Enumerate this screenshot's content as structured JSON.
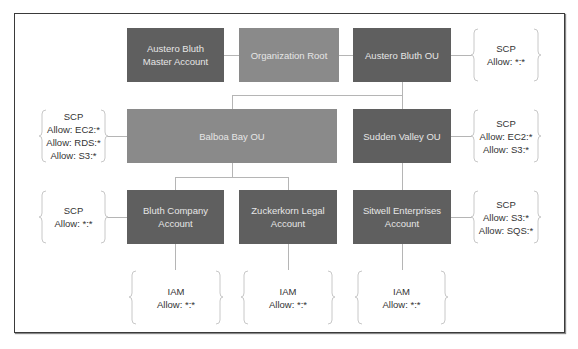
{
  "diagram": {
    "type": "AWS Organizations hierarchy with SCP/IAM policies",
    "colors": {
      "account_box": "#5f5f5f",
      "ou_box": "#8a8a8a",
      "box_text": "#e6e6e6",
      "policy_text": "#333333",
      "connector": "#b5b5b5"
    },
    "nodes": {
      "master": "Austero Bluth Master Account",
      "root": "Organization Root",
      "austero_ou": "Austero Bluth OU",
      "balboa_ou": "Balboa Bay OU",
      "sudden_ou": "Sudden Valley OU",
      "bluth_acct": "Bluth Company Account",
      "zuck_acct": "Zuckerkorn Legal Account",
      "sitwell_acct": "Sitwell Enterprises Account"
    },
    "master_l1": "Austero Bluth",
    "master_l2": "Master Account",
    "bluth_l1": "Bluth Company",
    "bluth_l2": "Account",
    "zuck_l1": "Zuckerkorn Legal",
    "zuck_l2": "Account",
    "sitwell_l1": "Sitwell Enterprises",
    "sitwell_l2": "Account",
    "policies": {
      "austero_scp": {
        "title": "SCP",
        "lines": [
          "Allow: *:*"
        ]
      },
      "balboa_scp": {
        "title": "SCP",
        "lines": [
          "Allow: EC2:*",
          "Allow: RDS:*",
          "Allow: S3:*"
        ]
      },
      "sudden_scp": {
        "title": "SCP",
        "lines": [
          "Allow: EC2:*",
          "Allow: S3:*"
        ]
      },
      "bluth_scp": {
        "title": "SCP",
        "lines": [
          "Allow: *:*"
        ]
      },
      "sitwell_scp": {
        "title": "SCP",
        "lines": [
          "Allow: S3:*",
          "Allow: SQS:*"
        ]
      },
      "bluth_iam": {
        "title": "IAM",
        "lines": [
          "Allow: *:*"
        ]
      },
      "zuck_iam": {
        "title": "IAM",
        "lines": [
          "Allow: *:*"
        ]
      },
      "sitwell_iam": {
        "title": "IAM",
        "lines": [
          "Allow: *:*"
        ]
      }
    }
  }
}
